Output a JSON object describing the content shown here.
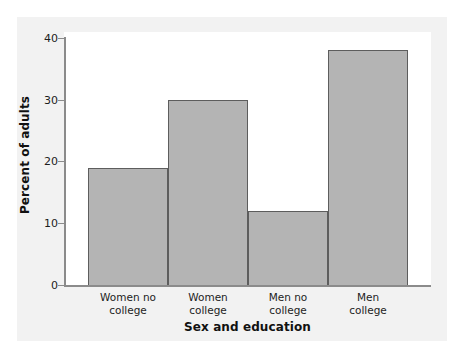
{
  "chart_data": {
    "type": "bar",
    "title": "",
    "subtitle": "",
    "categories": [
      "Women no college",
      "Women college",
      "Men no college",
      "Men college"
    ],
    "category_lines": [
      [
        "Women no",
        "college"
      ],
      [
        "Women",
        "college"
      ],
      [
        "Men no",
        "college"
      ],
      [
        "Men",
        "college"
      ]
    ],
    "values": [
      19.1,
      30.0,
      12.1,
      38.1
    ],
    "xlabel": "Sex and education",
    "ylabel": "Percent of adults",
    "ylim": [
      0,
      40
    ],
    "yticks": [
      0,
      10,
      20,
      30,
      40
    ],
    "ytick_labels": [
      "0",
      "10",
      "20",
      "30",
      "40"
    ],
    "grid": false,
    "legend": null,
    "bar_fill_color": "#b4b4b4",
    "bar_edge_color": "#5d5d5d",
    "axis_color": "#8b8b8b",
    "plot_background": "#ffffff",
    "panel_background": "#f2f2f2"
  }
}
